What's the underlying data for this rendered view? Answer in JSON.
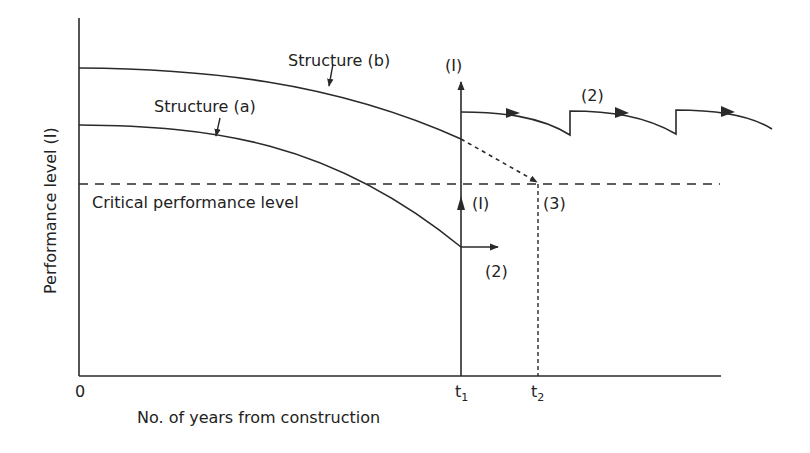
{
  "diagram": {
    "type": "performance-degradation-diagram",
    "y_axis_label": "Performance level (I)",
    "x_axis_label": "No. of years from construction",
    "origin_label": "0",
    "critical_level_label": "Critical performance level",
    "t1_label": "t",
    "t1_sub": "1",
    "t2_label": "t",
    "t2_sub": "2",
    "structure_a_label": "Structure (a)",
    "structure_b_label": "Structure (b)",
    "annotation_1_top": "(I)",
    "annotation_1_mid": "(I)",
    "annotation_2_top": "(2)",
    "annotation_2_bottom": "(2)",
    "annotation_3": "(3)",
    "line_color": "#2a2a2a"
  }
}
